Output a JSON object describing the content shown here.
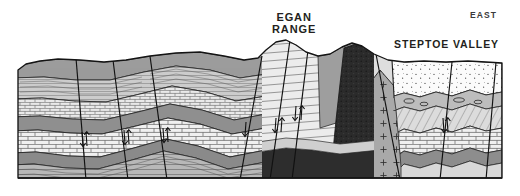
{
  "figure": {
    "type": "geologic-cross-section",
    "orientation_label": "EAST",
    "background_color": "#ffffff",
    "frame": {
      "x": 18,
      "y": 56,
      "width": 484,
      "height": 122,
      "baseline_y": 178
    }
  },
  "labels": {
    "egan_range": "EGAN\nRANGE",
    "steptoe_valley": "STEPTOE VALLEY",
    "east": "EAST"
  },
  "palette": {
    "outline": "#1a1a1a",
    "white": "#ffffff",
    "very_light": "#f2f2f2",
    "light": "#e2e2e2",
    "light_mid": "#cfcfcf",
    "mid": "#b4b4b4",
    "mid_dark": "#9a9a9a",
    "dark": "#7d7d7d",
    "very_dark": "#4a4a4a",
    "black_unit": "#2a2a2a",
    "label_color": "#231f20"
  },
  "map_units": [
    {
      "id": "u-shale-fine",
      "name": "finely laminated shale",
      "fill": "#b4b4b4",
      "pattern": "thin-horizontal-lines"
    },
    {
      "id": "u-limestone",
      "name": "limestone (brick pattern)",
      "fill": "#efefef",
      "pattern": "brick"
    },
    {
      "id": "u-siltstone",
      "name": "siltstone",
      "fill": "#9a9a9a",
      "pattern": "solid"
    },
    {
      "id": "u-sandstone",
      "name": "sandstone",
      "fill": "#cfcfcf",
      "pattern": "solid"
    },
    {
      "id": "u-quartzite",
      "name": "quartzite (diagonal hatch)",
      "fill": "#d8d8d8",
      "pattern": "diagonal-hatch"
    },
    {
      "id": "u-basement",
      "name": "dark basement rock",
      "fill": "#2a2a2a",
      "pattern": "dense-stipple"
    },
    {
      "id": "u-granite",
      "name": "granitic pluton",
      "fill": "#a8a8a8",
      "pattern": "cross-plus"
    },
    {
      "id": "u-valleyfill",
      "name": "basin / valley fill alluvium",
      "fill": "#fafafa",
      "pattern": "stipple-dots"
    }
  ],
  "structures": [
    {
      "id": "f1",
      "type": "normal-fault",
      "label": null,
      "slip_arrows": true
    },
    {
      "id": "f2",
      "type": "normal-fault",
      "label": null,
      "slip_arrows": true
    },
    {
      "id": "f3",
      "type": "normal-fault",
      "label": null,
      "slip_arrows": true
    },
    {
      "id": "f4",
      "type": "normal-fault",
      "label": null,
      "slip_arrows": true
    },
    {
      "id": "f5",
      "type": "normal-fault",
      "label": null,
      "slip_arrows": true
    },
    {
      "id": "f6",
      "type": "normal-fault",
      "label": null,
      "slip_arrows": true
    },
    {
      "id": "f7",
      "type": "normal-fault",
      "label": null,
      "slip_arrows": true
    },
    {
      "id": "fold-anticline",
      "type": "anticline",
      "label": null,
      "slip_arrows": false
    },
    {
      "id": "fold-syncline",
      "type": "syncline",
      "label": null,
      "slip_arrows": false
    }
  ]
}
